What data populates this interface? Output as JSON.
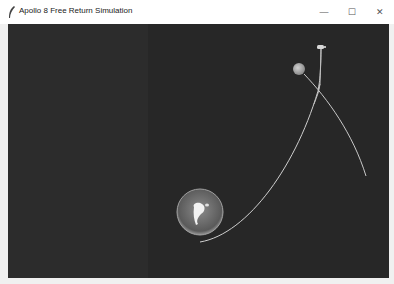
{
  "window": {
    "title": "Apollo 8 Free Return Simulation",
    "icon": "feather-icon",
    "controls": {
      "minimize": "—",
      "maximize": "☐",
      "close": "✕"
    }
  },
  "scene": {
    "background": "#2a2a2a",
    "earth": {
      "cx": 192,
      "cy": 188,
      "r": 23,
      "fill": "#6a6a6a"
    },
    "moon": {
      "cx": 291,
      "cy": 45,
      "r": 6,
      "fill": "#a8a8a8"
    },
    "spacecraft": {
      "cx": 313,
      "cy": 23
    },
    "trajectory_color": "#c8c8c8"
  }
}
